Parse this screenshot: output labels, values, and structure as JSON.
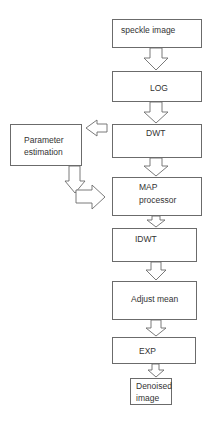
{
  "diagram": {
    "type": "flowchart",
    "nodes": {
      "speckle_image": "speckle image",
      "log": "LOG",
      "dwt": "DWT",
      "parameter_estimation_line1": "Parameter",
      "parameter_estimation_line2": "estimation",
      "map_processor_line1": "MAP",
      "map_processor_line2": "processor",
      "idwt": "IDWT",
      "adjust_mean": "Adjust mean",
      "exp": "EXP",
      "denoised_image_line1": "Denoised",
      "denoised_image_line2": "image"
    },
    "edges": [
      [
        "speckle image",
        "LOG"
      ],
      [
        "LOG",
        "DWT"
      ],
      [
        "DWT",
        "Parameter estimation"
      ],
      [
        "DWT",
        "MAP processor"
      ],
      [
        "Parameter estimation",
        "MAP processor"
      ],
      [
        "MAP processor",
        "IDWT"
      ],
      [
        "IDWT",
        "Adjust mean"
      ],
      [
        "Adjust mean",
        "EXP"
      ],
      [
        "EXP",
        "Denoised image"
      ]
    ]
  }
}
